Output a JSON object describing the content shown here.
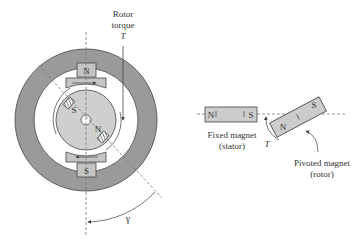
{
  "colors": {
    "stator_ring": "#9a9a9a",
    "rotor_disc": "#cfcfcf",
    "pole_piece": "#c4c4c4",
    "magnet_fill": "#cccccc",
    "outline": "#444444",
    "background": "#ffffff"
  },
  "motor": {
    "rotor_torque_label": "Rotor",
    "rotor_torque_label2": "torque",
    "torque_symbol": "T",
    "stator_top_pole": "N",
    "stator_bottom_pole": "S",
    "rotor_pole_s": "S",
    "rotor_pole_n": "N",
    "angle_symbol": "γ"
  },
  "bar_magnets": {
    "fixed": {
      "north": "N",
      "south": "S",
      "label_line1": "Fixed magnet",
      "label_line2": "(stator)"
    },
    "pivoted": {
      "north": "N",
      "south": "S",
      "label_line1": "Pivoted magnet",
      "label_line2": "(rotor)"
    },
    "torque_symbol": "T"
  }
}
